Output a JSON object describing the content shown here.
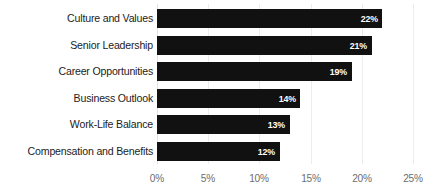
{
  "chart_data": {
    "type": "bar",
    "orientation": "horizontal",
    "title": "",
    "subtitle": "",
    "xlabel": "",
    "ylabel": "",
    "xlim": [
      0,
      25
    ],
    "grid": true,
    "legend": null,
    "value_label_format": "{v}%",
    "categories": [
      "Culture and Values",
      "Senior Leadership",
      "Career Opportunities",
      "Business Outlook",
      "Work-Life Balance",
      "Compensation and Benefits"
    ],
    "values": [
      22,
      21,
      19,
      14,
      13,
      12
    ],
    "value_labels": [
      "22%",
      "21%",
      "19%",
      "14%",
      "13%",
      "12%"
    ],
    "xticks": [
      0,
      5,
      10,
      15,
      20,
      25
    ],
    "xtick_labels": [
      "0%",
      "5%",
      "10%",
      "15%",
      "20%",
      "25%"
    ],
    "colors": {
      "bar": "#111111",
      "value_label": "#ffffff",
      "category_label": "#1c1c1c",
      "tick_label": "#6d6d6d",
      "gridline": "#ededed",
      "background": "#ffffff"
    }
  }
}
